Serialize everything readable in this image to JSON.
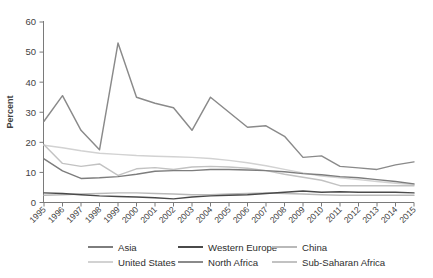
{
  "chart_data": {
    "type": "line",
    "title": "",
    "subtitle": "",
    "xlabel": "",
    "ylabel": "Percent",
    "xlim": [
      1995,
      2015
    ],
    "ylim": [
      0,
      60
    ],
    "yticks": [
      0,
      10,
      20,
      30,
      40,
      50,
      60
    ],
    "grid": false,
    "legend_position": "bottom",
    "categories": [
      "1995",
      "1996",
      "1997",
      "1998",
      "1999",
      "2000",
      "2001",
      "2002",
      "2003",
      "2004",
      "2005",
      "2006",
      "2007",
      "2008",
      "2009",
      "2010",
      "2011",
      "2012",
      "2013",
      "2014",
      "2015"
    ],
    "series": [
      {
        "name": "Asia",
        "color": "#7d7d7d",
        "values": [
          14.5,
          10.5,
          8.0,
          8.2,
          8.6,
          9.4,
          10.4,
          10.6,
          10.6,
          11.0,
          11.0,
          10.8,
          10.6,
          10.2,
          9.6,
          9.2,
          8.6,
          8.2,
          7.6,
          7.0,
          6.2
        ]
      },
      {
        "name": "Western Europe",
        "color": "#4a4a4a",
        "values": [
          3.2,
          3.0,
          2.6,
          2.2,
          2.0,
          1.8,
          1.6,
          1.2,
          1.8,
          2.2,
          2.4,
          2.6,
          3.0,
          3.4,
          3.8,
          3.4,
          3.6,
          3.4,
          3.4,
          3.4,
          3.2
        ]
      },
      {
        "name": "China",
        "color": "#b9b9b9",
        "values": [
          2.4,
          2.6,
          2.8,
          3.0,
          3.2,
          3.2,
          3.0,
          2.8,
          2.6,
          2.6,
          2.8,
          3.0,
          3.2,
          3.0,
          2.8,
          2.6,
          2.4,
          2.4,
          2.4,
          2.4,
          2.4
        ]
      },
      {
        "name": "United States",
        "color": "#d2d2d2",
        "values": [
          19.0,
          18.2,
          17.2,
          16.4,
          16.0,
          15.6,
          15.4,
          15.2,
          15.0,
          14.6,
          14.0,
          13.2,
          12.2,
          11.0,
          9.8,
          8.8,
          8.2,
          7.6,
          7.0,
          6.4,
          6.0
        ]
      },
      {
        "name": "North Africa",
        "color": "#8a8a8a",
        "values": [
          27.0,
          35.5,
          24.0,
          17.5,
          53.0,
          35.0,
          33.0,
          31.5,
          24.0,
          35.0,
          30.0,
          25.0,
          25.5,
          22.0,
          15.0,
          15.5,
          12.0,
          11.5,
          11.0,
          12.5,
          13.5
        ]
      },
      {
        "name": "Sub-Saharan Africa",
        "color": "#c2c2c2",
        "values": [
          19.2,
          13.0,
          12.0,
          12.8,
          9.0,
          11.2,
          11.6,
          11.0,
          11.8,
          12.0,
          11.8,
          11.4,
          10.6,
          9.4,
          8.4,
          7.4,
          5.6,
          5.6,
          5.6,
          5.6,
          5.6
        ]
      }
    ]
  },
  "axes": {
    "ylabel": "Percent",
    "ytick_labels": [
      "0",
      "10",
      "20",
      "30",
      "40",
      "50",
      "60"
    ],
    "xtick_labels": [
      "1995",
      "1996",
      "1997",
      "1998",
      "1999",
      "2000",
      "2001",
      "2002",
      "2003",
      "2004",
      "2005",
      "2006",
      "2007",
      "2008",
      "2009",
      "2010",
      "2011",
      "2012",
      "2013",
      "2014",
      "2015"
    ]
  },
  "legend": {
    "rows": [
      [
        {
          "label": "Asia",
          "color": "#7d7d7d"
        },
        {
          "label": "Western Europe",
          "color": "#4a4a4a"
        },
        {
          "label": "China",
          "color": "#b9b9b9"
        }
      ],
      [
        {
          "label": "United States",
          "color": "#d2d2d2"
        },
        {
          "label": "North Africa",
          "color": "#8a8a8a"
        },
        {
          "label": "Sub-Saharan Africa",
          "color": "#c2c2c2"
        }
      ]
    ]
  }
}
